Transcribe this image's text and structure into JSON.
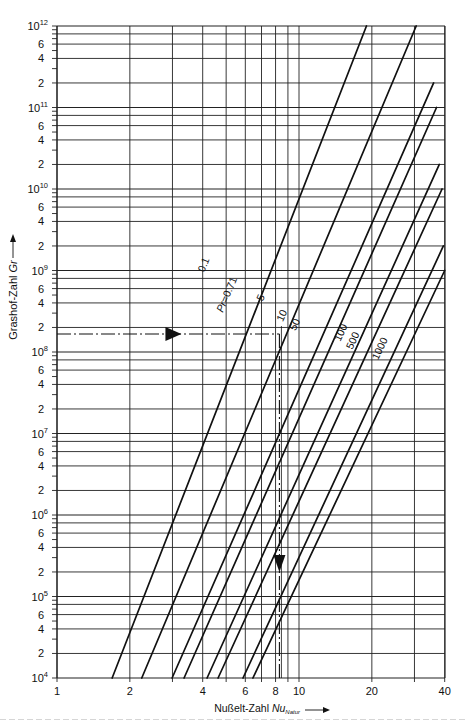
{
  "chart_data": {
    "type": "line",
    "title": "",
    "xlabel": "Nußelt-Zahl Nu",
    "xlabel_subscript": "Natur",
    "ylabel": "Grashof-Zahl Gr",
    "xscale": "log",
    "yscale": "log",
    "xlim": [
      1,
      40
    ],
    "ylim": [
      10000,
      1000000000000
    ],
    "grid": true,
    "x_ticks": [
      "1",
      "2",
      "4",
      "6",
      "8",
      "10",
      "20",
      "40"
    ],
    "x_gridlines": [
      1,
      2,
      3,
      4,
      5,
      6,
      7,
      8,
      9,
      10,
      20,
      30,
      40
    ],
    "y_ticks": [
      {
        "value": 10000.0,
        "label": "10",
        "exp": "4"
      },
      {
        "value": 20000.0,
        "label": "2"
      },
      {
        "value": 40000.0,
        "label": "4"
      },
      {
        "value": 60000.0,
        "label": "6"
      },
      {
        "value": 100000.0,
        "label": "10",
        "exp": "5"
      },
      {
        "value": 200000.0,
        "label": "2"
      },
      {
        "value": 400000.0,
        "label": "4"
      },
      {
        "value": 600000.0,
        "label": "6"
      },
      {
        "value": 1000000.0,
        "label": "10",
        "exp": "6"
      },
      {
        "value": 2000000.0,
        "label": "2"
      },
      {
        "value": 4000000.0,
        "label": "4"
      },
      {
        "value": 6000000.0,
        "label": "6"
      },
      {
        "value": 10000000.0,
        "label": "10",
        "exp": "7"
      },
      {
        "value": 20000000.0,
        "label": "2"
      },
      {
        "value": 40000000.0,
        "label": "4"
      },
      {
        "value": 60000000.0,
        "label": "6"
      },
      {
        "value": 100000000.0,
        "label": "10",
        "exp": "8"
      },
      {
        "value": 200000000.0,
        "label": "2"
      },
      {
        "value": 400000000.0,
        "label": "4"
      },
      {
        "value": 600000000.0,
        "label": "6"
      },
      {
        "value": 1000000000.0,
        "label": "10",
        "exp": "9"
      },
      {
        "value": 2000000000.0,
        "label": "2"
      },
      {
        "value": 4000000000.0,
        "label": "4"
      },
      {
        "value": 6000000000.0,
        "label": "6"
      },
      {
        "value": 10000000000.0,
        "label": "10",
        "exp": "10"
      },
      {
        "value": 20000000000.0,
        "label": "2"
      },
      {
        "value": 40000000000.0,
        "label": "4"
      },
      {
        "value": 60000000000.0,
        "label": "6"
      },
      {
        "value": 100000000000.0,
        "label": "10",
        "exp": "11"
      },
      {
        "value": 200000000000.0,
        "label": "2"
      },
      {
        "value": 400000000000.0,
        "label": "4"
      },
      {
        "value": 600000000000.0,
        "label": "6"
      },
      {
        "value": 1000000000000.0,
        "label": "10",
        "exp": "12"
      }
    ],
    "series": [
      {
        "name": "0.1",
        "label": "0.1",
        "points": [
          [
            1.69,
            10000.0
          ],
          [
            19.0,
            1000000000000.0
          ]
        ]
      },
      {
        "name": "Pr = 0.71",
        "label": "Pr = 0.71",
        "points": [
          [
            2.24,
            10000.0
          ],
          [
            30.5,
            1000000000000.0
          ]
        ]
      },
      {
        "name": "5",
        "label": "5",
        "points": [
          [
            2.99,
            10000.0
          ],
          [
            36.0,
            200000000000.0
          ]
        ]
      },
      {
        "name": "10",
        "label": "10",
        "points": [
          [
            3.35,
            10000.0
          ],
          [
            37.0,
            100000000000.0
          ]
        ]
      },
      {
        "name": "50",
        "label": "50",
        "points": [
          [
            4.17,
            10000.0
          ],
          [
            38.0,
            20000000000.0
          ]
        ]
      },
      {
        "name": "100",
        "label": "100",
        "points": [
          [
            4.63,
            10000.0
          ],
          [
            39.0,
            10000000000.0
          ]
        ]
      },
      {
        "name": "500",
        "label": "500",
        "points": [
          [
            5.87,
            10000.0
          ],
          [
            39.5,
            2000000000.0
          ]
        ]
      },
      {
        "name": "1000",
        "label": "1000",
        "points": [
          [
            6.45,
            10000.0
          ],
          [
            40.0,
            1000000000.0
          ]
        ]
      }
    ],
    "annotations": [
      {
        "type": "dash-dot-line",
        "direction": "horizontal",
        "from": [
          1,
          166000000.0
        ],
        "to": [
          8.3,
          166000000.0
        ],
        "arrow_at": [
          3.0,
          166000000.0
        ],
        "arrow": "right"
      },
      {
        "type": "dash-dot-line",
        "direction": "vertical",
        "from": [
          8.3,
          166000000.0
        ],
        "to": [
          8.3,
          10000.0
        ],
        "arrow_at": [
          8.3,
          250000.0
        ],
        "arrow": "down"
      }
    ],
    "ylabel_arrow": "up",
    "xlabel_arrow": "right"
  }
}
